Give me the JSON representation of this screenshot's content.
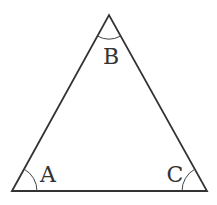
{
  "diagram": {
    "type": "triangle",
    "stroke_color": "#333333",
    "vertices": [
      {
        "id": "A",
        "label": "A",
        "x": 12,
        "y": 191,
        "label_x": 48,
        "label_y": 182
      },
      {
        "id": "B",
        "label": "B",
        "x": 109,
        "y": 15,
        "label_x": 111,
        "label_y": 64
      },
      {
        "id": "C",
        "label": "C",
        "x": 207,
        "y": 191,
        "label_x": 175,
        "label_y": 182
      }
    ],
    "angle_arcs": [
      {
        "vertex": "A",
        "radius": 25
      },
      {
        "vertex": "B",
        "radius": 24
      },
      {
        "vertex": "C",
        "radius": 25
      }
    ]
  }
}
